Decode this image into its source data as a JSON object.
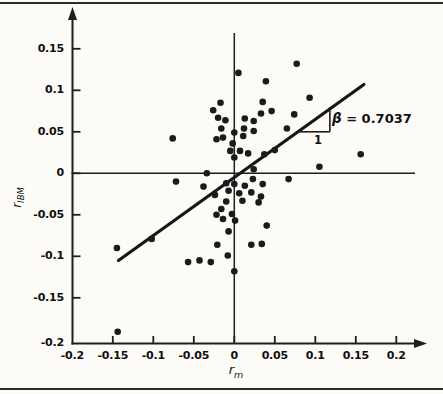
{
  "figure": {
    "ylabel_base": "r",
    "ylabel_sub": "IBM",
    "xlabel_base": "r",
    "xlabel_sub": "m",
    "beta_symbol": "β",
    "beta_value": " = 0.7037",
    "slope_run_label": "1"
  },
  "chart_data": {
    "type": "scatter",
    "title": "",
    "xlabel": "r_m",
    "ylabel": "r_IBM",
    "xlim": [
      -0.2,
      0.235
    ],
    "ylim": [
      -0.205,
      0.175
    ],
    "grid": false,
    "x_ticks": [
      -0.2,
      -0.15,
      -0.1,
      -0.05,
      0,
      0.05,
      0.1,
      0.15,
      0.2
    ],
    "y_ticks": [
      0.15,
      0.1,
      0.05,
      0,
      -0.05,
      -0.1,
      -0.15,
      -0.2
    ],
    "x_tick_labels": [
      "-0.2",
      "-0.15",
      "-0.1",
      "-0.05",
      "0",
      "0.05",
      "0.1",
      "0.15",
      "0.2"
    ],
    "y_tick_labels": [
      "0.15",
      "0.1",
      "0.05",
      "0",
      "-0.05",
      "-0.1",
      "-0.15",
      "-0.2"
    ],
    "regression_line": {
      "beta": 0.7037,
      "x1": -0.143,
      "y1": -0.105,
      "x2": 0.16,
      "y2": 0.107
    },
    "slope_triangle": {
      "x_left": 0.081,
      "x_right": 0.118,
      "y_base": 0.05,
      "y_top": 0.08
    },
    "points": [
      [
        0.005,
        0.121
      ],
      [
        0.077,
        0.132
      ],
      [
        0.039,
        0.111
      ],
      [
        0.093,
        0.091
      ],
      [
        0.035,
        0.086
      ],
      [
        -0.017,
        0.085
      ],
      [
        -0.026,
        0.076
      ],
      [
        -0.02,
        0.067
      ],
      [
        -0.011,
        0.064
      ],
      [
        0.013,
        0.066
      ],
      [
        0.024,
        0.063
      ],
      [
        0.046,
        0.075
      ],
      [
        0.033,
        0.072
      ],
      [
        0.074,
        0.071
      ],
      [
        0.065,
        0.054
      ],
      [
        -0.016,
        0.054
      ],
      [
        0.012,
        0.054
      ],
      [
        0.024,
        0.051
      ],
      [
        0.0,
        0.049
      ],
      [
        0.011,
        0.045
      ],
      [
        -0.014,
        0.043
      ],
      [
        -0.022,
        0.041
      ],
      [
        -0.076,
        0.042
      ],
      [
        -0.002,
        0.036
      ],
      [
        -0.005,
        0.027
      ],
      [
        0.007,
        0.027
      ],
      [
        0.05,
        0.028
      ],
      [
        0.017,
        0.024
      ],
      [
        0.037,
        0.023
      ],
      [
        0.156,
        0.023
      ],
      [
        0.0,
        0.019
      ],
      [
        0.024,
        0.005
      ],
      [
        0.105,
        0.008
      ],
      [
        -0.034,
        0.0
      ],
      [
        -0.072,
        -0.01
      ],
      [
        -0.038,
        -0.016
      ],
      [
        -0.01,
        -0.012
      ],
      [
        0.023,
        -0.007
      ],
      [
        0.067,
        -0.007
      ],
      [
        0.035,
        -0.013
      ],
      [
        0.013,
        -0.015
      ],
      [
        0.0,
        -0.013
      ],
      [
        -0.024,
        -0.026
      ],
      [
        -0.007,
        -0.021
      ],
      [
        0.006,
        -0.024
      ],
      [
        0.021,
        -0.023
      ],
      [
        0.033,
        -0.028
      ],
      [
        0.01,
        -0.033
      ],
      [
        0.03,
        -0.035
      ],
      [
        -0.01,
        -0.034
      ],
      [
        -0.016,
        -0.043
      ],
      [
        -0.022,
        -0.05
      ],
      [
        -0.003,
        -0.049
      ],
      [
        -0.014,
        -0.055
      ],
      [
        0.001,
        -0.057
      ],
      [
        -0.007,
        -0.07
      ],
      [
        0.04,
        -0.063
      ],
      [
        -0.021,
        -0.086
      ],
      [
        0.021,
        -0.086
      ],
      [
        0.034,
        -0.085
      ],
      [
        -0.008,
        -0.099
      ],
      [
        -0.102,
        -0.079
      ],
      [
        -0.145,
        -0.09
      ],
      [
        -0.057,
        -0.107
      ],
      [
        -0.043,
        -0.105
      ],
      [
        -0.029,
        -0.107
      ],
      [
        0.0,
        -0.118
      ],
      [
        -0.144,
        -0.191
      ]
    ],
    "point_color": "#1b1b1b",
    "axis_color": "#1e1e1e",
    "line_color": "#161616"
  }
}
